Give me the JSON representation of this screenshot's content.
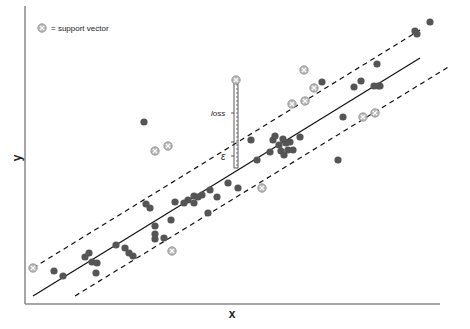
{
  "chart_data": {
    "type": "scatter",
    "title": "",
    "xlabel": "x",
    "ylabel": "y",
    "grid": false,
    "legend": {
      "position": "top-left",
      "entries": [
        {
          "symbol": "circled-x",
          "label": "= support vector"
        }
      ]
    },
    "annotations": [
      {
        "text": "loss",
        "style": "italic",
        "x": 225,
        "y": 113
      },
      {
        "text": "ε",
        "style": "italic",
        "x": 228,
        "y": 157
      }
    ],
    "lines": {
      "regression": {
        "style": "solid",
        "x1": 33,
        "y1": 296,
        "x2": 420,
        "y2": 58
      },
      "upper_margin": {
        "style": "dashed",
        "x1": 33,
        "y1": 268,
        "x2": 420,
        "y2": 30
      },
      "lower_margin": {
        "style": "dashed",
        "x1": 75,
        "y1": 296,
        "x2": 450,
        "y2": 66
      }
    },
    "loss_bar": {
      "x": 236,
      "y_top": 80,
      "y_mid": 142,
      "y_bottom": 168
    },
    "points": [
      [
        54,
        271
      ],
      [
        63,
        276
      ],
      [
        85,
        257
      ],
      [
        89,
        253
      ],
      [
        92,
        262
      ],
      [
        97,
        263
      ],
      [
        96,
        273
      ],
      [
        116,
        245
      ],
      [
        125,
        248
      ],
      [
        129,
        253
      ],
      [
        133,
        256
      ],
      [
        146,
        204
      ],
      [
        150,
        208
      ],
      [
        155,
        226
      ],
      [
        155,
        234
      ],
      [
        155,
        239
      ],
      [
        164,
        238
      ],
      [
        171,
        220
      ],
      [
        175,
        202
      ],
      [
        184,
        203
      ],
      [
        188,
        200
      ],
      [
        194,
        196
      ],
      [
        194,
        203
      ],
      [
        198,
        197
      ],
      [
        202,
        195
      ],
      [
        208,
        213
      ],
      [
        210,
        190
      ],
      [
        217,
        197
      ],
      [
        228,
        183
      ],
      [
        238,
        188
      ],
      [
        251,
        140
      ],
      [
        257,
        160
      ],
      [
        270,
        152
      ],
      [
        273,
        140
      ],
      [
        275,
        136
      ],
      [
        279,
        145
      ],
      [
        281,
        151
      ],
      [
        283,
        139
      ],
      [
        284,
        155
      ],
      [
        286,
        143
      ],
      [
        288,
        150
      ],
      [
        290,
        142
      ],
      [
        293,
        150
      ],
      [
        300,
        137
      ],
      [
        322,
        82
      ],
      [
        338,
        160
      ],
      [
        343,
        117
      ],
      [
        354,
        87
      ],
      [
        361,
        81
      ],
      [
        374,
        86
      ],
      [
        377,
        64
      ],
      [
        378,
        86
      ],
      [
        380,
        86
      ],
      [
        415,
        31
      ],
      [
        417,
        34
      ],
      [
        430,
        22
      ],
      [
        144,
        122
      ]
    ],
    "support_vectors": [
      [
        33,
        268
      ],
      [
        155,
        151
      ],
      [
        168,
        146
      ],
      [
        172,
        251
      ],
      [
        236,
        80
      ],
      [
        262,
        188
      ],
      [
        304,
        70
      ],
      [
        314,
        88
      ],
      [
        292,
        104
      ],
      [
        305,
        101
      ],
      [
        363,
        117
      ],
      [
        375,
        113
      ]
    ]
  },
  "legend": {
    "label": "= support vector"
  },
  "axes": {
    "x_label": "x",
    "y_label": "y"
  },
  "annotations": {
    "loss": "loss",
    "epsilon": "ε"
  }
}
